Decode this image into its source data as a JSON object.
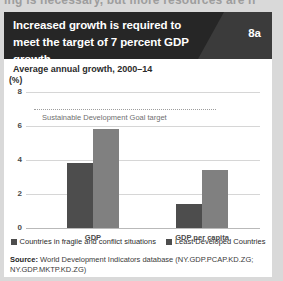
{
  "page": {
    "ghost_line_above": "ing is necessary, but more resources are n",
    "background_color": "#d9d9d9"
  },
  "figure": {
    "number_badge": "8a",
    "title": "Increased growth is required to meet the target of 7 percent GDP growth",
    "header_bg": "#262626",
    "header_wedge_bg": "#3b3b3b",
    "subtitle": "Average annual growth, 2000–14",
    "units": "(%)",
    "source_label": "Source:",
    "source_text": " World Development Indicators database (NY.GDP.PCAP.KD.ZG; NY.GDP.MKTP.KD.ZG)"
  },
  "chart_data": {
    "type": "bar",
    "title": "Increased growth is required to meet the target of 7 percent GDP growth",
    "subtitle": "Average annual growth, 2000–14",
    "xlabel": "",
    "ylabel": "(%)",
    "ylim": [
      0,
      8
    ],
    "yticks": [
      0,
      2,
      4,
      6,
      8
    ],
    "ytick_labels": [
      "0",
      "2",
      "4",
      "6",
      "8"
    ],
    "grid": true,
    "legend_position": "bottom",
    "categories": [
      "GDP",
      "GDP per capita"
    ],
    "series": [
      {
        "name": "Countries in fragile and conflict situations",
        "color": "#4d4d4d",
        "values": [
          3.8,
          1.4
        ]
      },
      {
        "name": "Least Developed Countries",
        "color": "#808080",
        "values": [
          5.8,
          3.4
        ]
      }
    ],
    "annotations": [
      {
        "type": "hline",
        "value": 7,
        "label": "Sustainable Development Goal target",
        "style": "dotted",
        "color": "#9d9d9d"
      }
    ]
  }
}
